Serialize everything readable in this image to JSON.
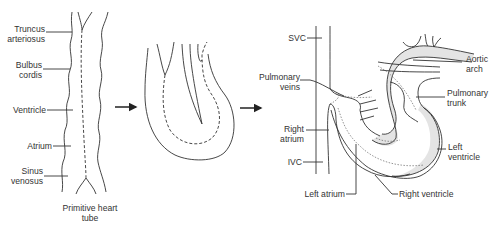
{
  "figure": {
    "panel1": {
      "caption": "Primitive heart\ntube",
      "labels": {
        "truncus": "Truncus\narteriosus",
        "bulbus": "Bulbus\ncordis",
        "ventricle": "Ventricle",
        "atrium": "Atrium",
        "sinus": "Sinus\nvenosus"
      }
    },
    "panel3": {
      "labels": {
        "svc": "SVC",
        "pulmonary_veins": "Pulmonary\nveins",
        "right_atrium": "Right\natrium",
        "ivc": "IVC",
        "left_atrium": "Left atrium",
        "aortic_arch": "Aortic\narch",
        "pulmonary_trunk": "Pulmonary\ntrunk",
        "left_ventricle": "Left\nventricle",
        "right_ventricle": "Right ventricle"
      }
    },
    "arrows": [
      "arrow-1-to-2",
      "arrow-2-to-3"
    ],
    "colors": {
      "stroke": "#333333",
      "shade": "#e4e4e4",
      "text": "#333333",
      "background": "#ffffff"
    }
  }
}
